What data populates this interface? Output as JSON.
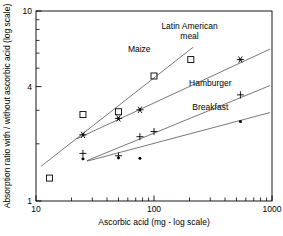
{
  "chart_data": {
    "type": "scatter",
    "title": "",
    "xlabel": "Ascorbic acid (mg - log scale)",
    "ylabel": "Absorption ratio with / without ascorbic acid (log scale)",
    "xscale": "log",
    "yscale": "log",
    "xlim": [
      10,
      1000
    ],
    "ylim": [
      1,
      10
    ],
    "grid": false,
    "legend_position": "inline-annotations",
    "xticks": [
      10,
      100,
      1000
    ],
    "xtick_labels": [
      "10",
      "100",
      "1000"
    ],
    "xminor_ticks": [
      20,
      30,
      40,
      50,
      60,
      70,
      80,
      90,
      200,
      300,
      400,
      500,
      600,
      700,
      800,
      900
    ],
    "yticks": [
      1,
      4,
      10
    ],
    "ytick_labels": [
      "1",
      "4",
      "10"
    ],
    "yminor_ticks": [
      2,
      3,
      5,
      6,
      7,
      8,
      9
    ],
    "series": [
      {
        "name": "Maize",
        "marker": "open-square",
        "label": "Maize",
        "label_x": 75,
        "label_y": 6.1,
        "points": [
          {
            "x": 13,
            "y": 1.32
          },
          {
            "x": 25,
            "y": 2.85
          },
          {
            "x": 50,
            "y": 2.95
          },
          {
            "x": 100,
            "y": 4.55
          },
          {
            "x": 205,
            "y": 5.55
          }
        ],
        "fit_line": {
          "x1": 11,
          "y1": 1.52,
          "x2": 215,
          "y2": 6.45
        }
      },
      {
        "name": "Latin American meal",
        "marker": "star",
        "label": "Latin American meal",
        "label_x": 200,
        "label_y": 8.0,
        "points": [
          {
            "x": 25,
            "y": 2.23
          },
          {
            "x": 50,
            "y": 2.72
          },
          {
            "x": 76,
            "y": 3.02
          },
          {
            "x": 540,
            "y": 5.55
          }
        ],
        "fit_line": {
          "x1": 22,
          "y1": 2.12,
          "x2": 960,
          "y2": 6.3
        }
      },
      {
        "name": "Hamburger",
        "marker": "plus",
        "label": "Hamburger",
        "label_x": 300,
        "label_y": 4.05,
        "points": [
          {
            "x": 25,
            "y": 1.78
          },
          {
            "x": 50,
            "y": 1.73
          },
          {
            "x": 76,
            "y": 2.18
          },
          {
            "x": 100,
            "y": 2.32
          },
          {
            "x": 540,
            "y": 3.62
          }
        ],
        "fit_line": {
          "x1": 27,
          "y1": 1.63,
          "x2": 960,
          "y2": 4.05
        }
      },
      {
        "name": "Breakfast",
        "marker": "dot",
        "label": "Breakfast",
        "label_x": 300,
        "label_y": 3.0,
        "points": [
          {
            "x": 25,
            "y": 1.67
          },
          {
            "x": 50,
            "y": 1.69
          },
          {
            "x": 76,
            "y": 1.68
          },
          {
            "x": 540,
            "y": 2.62
          }
        ],
        "fit_line": {
          "x1": 27,
          "y1": 1.62,
          "x2": 960,
          "y2": 2.92
        }
      }
    ]
  },
  "colors": {
    "axis": "#000000",
    "marker": "#000000",
    "line": "#555555",
    "background": "#ffffff"
  }
}
